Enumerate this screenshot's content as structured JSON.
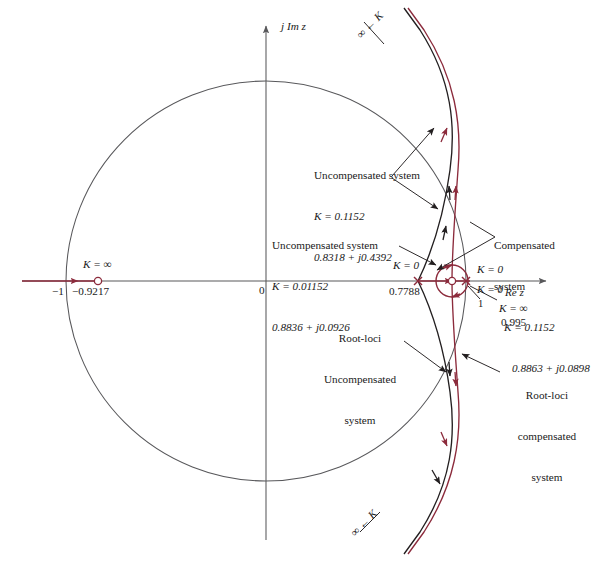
{
  "figure": {
    "type": "root-locus-z-plane",
    "top_caption": "",
    "axes": {
      "imag_label": "j Im z",
      "real_label": "Re z",
      "origin_label": "0",
      "unit_circle_left_label": "−1",
      "unit_circle_radius_note": "unit circle"
    },
    "colors": {
      "compensated_locus": "#8c2b3c",
      "uncompensated_locus": "#231f20",
      "unit_circle": "#58585b",
      "axis": "#58585b",
      "marker_red": "#8c2b3c",
      "leader": "#231f20",
      "background": "#ffffff"
    },
    "annotations": [
      {
        "id": "uncompensated-high-gain",
        "lines": [
          "Uncompensated system",
          "K = 0.1152",
          "0.8318 + j0.4392"
        ],
        "k": "0.1152",
        "root": "0.8318 + j0.4392"
      },
      {
        "id": "uncompensated-low-gain",
        "lines": [
          "Uncompensated system",
          "K = 0.01152",
          "0.8836 + j0.0926"
        ],
        "k": "0.01152",
        "root": "0.8836 + j0.0926"
      },
      {
        "id": "compensated",
        "lines": [
          "Compensated",
          "system",
          "K = 0.1152",
          "0.8863 + j0.0898"
        ],
        "k": "0.1152",
        "root": "0.8863 + j0.0898"
      },
      {
        "id": "root-loci-uncompensated",
        "lines": [
          "Root-loci",
          "Uncompensated",
          "system"
        ]
      },
      {
        "id": "root-loci-compensated",
        "lines": [
          "Root-loci",
          "compensated",
          "system"
        ]
      }
    ],
    "markers": [
      {
        "id": "zero-left",
        "symbol": "o",
        "k_label": "K = ∞",
        "value_label": "−0.9217",
        "x": -0.9217,
        "y": 0.0
      },
      {
        "id": "pole-07788",
        "symbol": "×",
        "k_label": "K = 0",
        "value_label": "0.7788",
        "x": 0.7788,
        "y": 0.0
      },
      {
        "id": "pole-unit-a",
        "symbol": "×",
        "k_label": "K = 0",
        "value_label": "",
        "x": 0.995,
        "y": 0.0
      },
      {
        "id": "pole-unit-b",
        "symbol": "×",
        "k_label": "K = 0",
        "value_label": "1",
        "x": 1.0,
        "y": 0.0
      },
      {
        "id": "zero-0995",
        "symbol": "o",
        "k_label": "K = ∞",
        "value_label": "0.995",
        "x": 0.995,
        "y": 0.0
      }
    ],
    "asymptote_labels": [
      {
        "id": "asymptote-top",
        "text": "∞ ← K",
        "rotation": -45
      },
      {
        "id": "asymptote-bottom",
        "text": "∞ ← K",
        "rotation": -45
      }
    ],
    "axis_ticks": {
      "minus_one": "−1",
      "origin": "0"
    }
  }
}
